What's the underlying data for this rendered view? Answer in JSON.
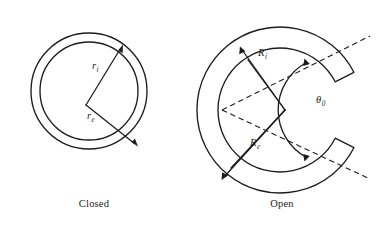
{
  "figure": {
    "background_color": "#ffffff",
    "line_color": "#1c1c1c",
    "panels": [
      {
        "id": "closed",
        "caption": "Closed",
        "description": "closed circular ring annulus",
        "center": {
          "x": 89,
          "y": 91
        },
        "outer_radius": 58,
        "inner_radius": 49,
        "labels": [
          {
            "symbol": "r",
            "subscript": "i",
            "meaning": "inner radius",
            "x": 92,
            "y": 69
          },
          {
            "symbol": "r",
            "subscript": "e",
            "meaning": "outer radius",
            "x": 87,
            "y": 119
          }
        ]
      },
      {
        "id": "open",
        "caption": "Open",
        "description": "open C-shaped ring annulus with angular gap",
        "center": {
          "x": 280,
          "y": 110
        },
        "outer_radius": 83,
        "inner_radius": 62,
        "gap_start_deg": -27,
        "gap_end_deg": 27,
        "labels": [
          {
            "symbol": "R",
            "subscript": "i",
            "meaning": "inner radius",
            "x": 258,
            "y": 56
          },
          {
            "symbol": "R",
            "subscript": "e",
            "meaning": "outer radius",
            "x": 250,
            "y": 146
          },
          {
            "symbol": "θ",
            "subscript": "0",
            "meaning": "opening angle",
            "x": 318,
            "y": 103
          }
        ],
        "dashed_origin": {
          "x": 222,
          "y": 110
        }
      }
    ]
  },
  "captions": {
    "left": "Closed",
    "right": "Open"
  }
}
